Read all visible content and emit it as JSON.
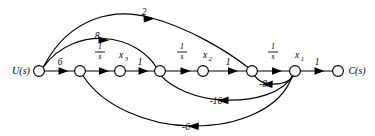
{
  "figure": {
    "type": "signal-flow-graph",
    "background_color": "#ffffff",
    "stroke_color": "#000000"
  },
  "io": {
    "input_label": "U(s)",
    "output_label": "C(s)"
  },
  "nodes": [
    {
      "id": "u",
      "label": "U(s)",
      "x": 39,
      "y": 71,
      "r": 5.4,
      "kind": "source"
    },
    {
      "id": "n2",
      "label": "",
      "x": 80,
      "y": 71,
      "r": 5.4,
      "kind": "internal"
    },
    {
      "id": "x3",
      "label": "x3",
      "x": 120,
      "y": 71,
      "r": 5.4,
      "kind": "state"
    },
    {
      "id": "n4",
      "label": "",
      "x": 160,
      "y": 71,
      "r": 5.4,
      "kind": "internal"
    },
    {
      "id": "x2",
      "label": "x2",
      "x": 203,
      "y": 71,
      "r": 5.4,
      "kind": "state"
    },
    {
      "id": "n6",
      "label": "",
      "x": 252,
      "y": 71,
      "r": 5.4,
      "kind": "internal"
    },
    {
      "id": "x1",
      "label": "x1",
      "x": 295,
      "y": 71,
      "r": 5.4,
      "kind": "state"
    },
    {
      "id": "c",
      "label": "C(s)",
      "x": 338,
      "y": 71,
      "r": 5.4,
      "kind": "sink"
    }
  ],
  "node_labels": [
    {
      "name": "x3",
      "base": "x",
      "subscript": "3",
      "x": 123,
      "y": 56
    },
    {
      "name": "x2",
      "base": "x",
      "subscript": "2",
      "x": 207,
      "y": 56
    },
    {
      "name": "x1",
      "base": "x",
      "subscript": "1",
      "x": 299,
      "y": 56
    }
  ],
  "edges": [
    {
      "id": "e-u-n2",
      "from": "u",
      "to": "n2",
      "gain": "6",
      "kind": "forward",
      "label_x": 60,
      "label_y": 62
    },
    {
      "id": "e-n2-x3",
      "from": "n2",
      "to": "x3",
      "gain": "1/s",
      "kind": "forward",
      "label_x": 100,
      "label_y": 55
    },
    {
      "id": "e-x3-n4",
      "from": "x3",
      "to": "n4",
      "gain": "1",
      "kind": "forward",
      "label_x": 140,
      "label_y": 62
    },
    {
      "id": "e-n4-x2",
      "from": "n4",
      "to": "x2",
      "gain": "1/s",
      "kind": "forward",
      "label_x": 182,
      "label_y": 55
    },
    {
      "id": "e-x2-n6",
      "from": "x2",
      "to": "n6",
      "gain": "1",
      "kind": "forward",
      "label_x": 228,
      "label_y": 62
    },
    {
      "id": "e-n6-x1",
      "from": "n6",
      "to": "x1",
      "gain": "1/s",
      "kind": "forward",
      "label_x": 273,
      "label_y": 55
    },
    {
      "id": "e-x1-c",
      "from": "x1",
      "to": "c",
      "gain": "1",
      "kind": "forward",
      "label_x": 317,
      "label_y": 62
    },
    {
      "id": "e-u-n6",
      "from": "u",
      "to": "n6",
      "gain": "2",
      "kind": "feedforward-upper",
      "label_x": 144,
      "label_y": 14
    },
    {
      "id": "e-u-n4",
      "from": "u",
      "to": "n4",
      "gain": "8",
      "kind": "feedforward-upper",
      "label_x": 97,
      "label_y": 38
    },
    {
      "id": "e-x1-n6",
      "from": "x1",
      "to": "n6",
      "gain": "-16",
      "kind": "feedback-lower",
      "label_x": 216,
      "label_y": 101
    },
    {
      "id": "e-x1-n4",
      "from": "x1",
      "to": "n4",
      "gain": "-8",
      "kind": "feedback-lower",
      "label_x": 263,
      "label_y": 84
    },
    {
      "id": "e-x1-n2",
      "from": "x1",
      "to": "n2",
      "gain": "-6",
      "kind": "feedback-lower",
      "label_x": 186,
      "label_y": 127
    }
  ],
  "gains": {
    "u_to_n2": "6",
    "n2_to_x3": "1/s",
    "x3_to_n4": "1",
    "n4_to_x2": "1/s",
    "x2_to_n6": "1",
    "n6_to_x1": "1/s",
    "x1_to_c": "1",
    "u_to_n6": "2",
    "u_to_n4": "8",
    "x1_to_n6": "-16",
    "x1_to_n4": "-8",
    "x1_to_n2": "-6"
  },
  "fraction_labels": [
    {
      "id": "frac1",
      "numerator": "1",
      "denominator": "s",
      "x": 100,
      "y": 52
    },
    {
      "id": "frac2",
      "numerator": "1",
      "denominator": "s",
      "x": 182,
      "y": 52
    },
    {
      "id": "frac3",
      "numerator": "1",
      "denominator": "s",
      "x": 273,
      "y": 52
    }
  ],
  "scalar_labels": [
    {
      "id": "g6",
      "text": "6",
      "x": 60,
      "y": 63
    },
    {
      "id": "g1a",
      "text": "1",
      "x": 140,
      "y": 63
    },
    {
      "id": "g1b",
      "text": "1",
      "x": 228,
      "y": 63
    },
    {
      "id": "g1c",
      "text": "1",
      "x": 317,
      "y": 63
    },
    {
      "id": "g2",
      "text": "2",
      "x": 144,
      "y": 14
    },
    {
      "id": "g8",
      "text": "8",
      "x": 97,
      "y": 38
    },
    {
      "id": "gm16",
      "text": "-16",
      "x": 216,
      "y": 102
    },
    {
      "id": "gm8",
      "text": "-8",
      "x": 263,
      "y": 85
    },
    {
      "id": "gm6",
      "text": "-6",
      "x": 186,
      "y": 128
    }
  ]
}
